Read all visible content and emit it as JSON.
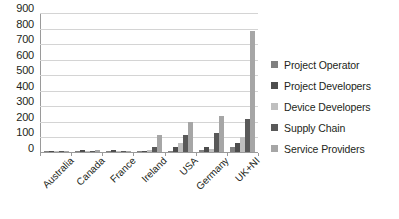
{
  "chart_data": {
    "type": "bar",
    "title": "",
    "xlabel": "",
    "ylabel": "",
    "ylim": [
      0,
      900
    ],
    "ytick_step": 100,
    "yticks": [
      900,
      800,
      700,
      600,
      500,
      400,
      300,
      200,
      100,
      0
    ],
    "grid": true,
    "legend_position": "right",
    "categories": [
      "Australia",
      "Canada",
      "France",
      "Ireland",
      "USA",
      "Germany",
      "UK+NI"
    ],
    "series": [
      {
        "name": "Project Operator",
        "color": "#808080",
        "values": [
          2,
          3,
          2,
          4,
          8,
          10,
          30
        ]
      },
      {
        "name": "Project Developers",
        "color": "#4d4d4d",
        "values": [
          3,
          10,
          10,
          8,
          35,
          30,
          60
        ]
      },
      {
        "name": "Device Developers",
        "color": "#bfbfbf",
        "values": [
          2,
          6,
          8,
          10,
          60,
          18,
          95
        ]
      },
      {
        "name": "Supply Chain",
        "color": "#595959",
        "values": [
          3,
          8,
          6,
          32,
          110,
          120,
          215
        ]
      },
      {
        "name": "Service Providers",
        "color": "#a6a6a6",
        "values": [
          4,
          12,
          9,
          112,
          195,
          230,
          780
        ]
      }
    ]
  },
  "legend": {
    "items": [
      {
        "label": "Project Operator",
        "color": "#808080"
      },
      {
        "label": "Project Developers",
        "color": "#4d4d4d"
      },
      {
        "label": "Device Developers",
        "color": "#bfbfbf"
      },
      {
        "label": "Supply Chain",
        "color": "#595959"
      },
      {
        "label": "Service Providers",
        "color": "#a6a6a6"
      }
    ]
  }
}
